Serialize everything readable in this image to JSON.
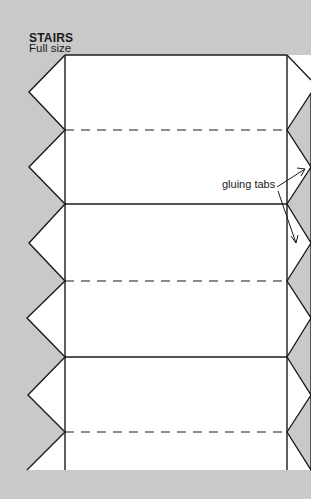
{
  "heading": {
    "title": "STAIRS",
    "subtitle": "Full size"
  },
  "annotation": {
    "label": "gluing tabs"
  },
  "template": {
    "solid_fold_lines_y": [
      55,
      204,
      357
    ],
    "dashed_fold_lines_y": [
      130,
      281,
      432
    ],
    "left_edge_x": 65,
    "right_edge_x": 287,
    "bottom_y": 470,
    "colors": {
      "background": "#c9c9c9",
      "paper": "#ffffff",
      "line": "#1a1a1a",
      "right_tab_fill": "#c9c9c9"
    }
  }
}
